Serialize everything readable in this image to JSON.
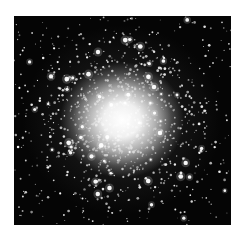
{
  "image": {
    "subject": "globular star cluster",
    "description": "Black-and-white astronomical photograph of a dense globular star cluster with a bright white core fading into scattered stars on a black sky, framed by a white border.",
    "colors": {
      "border": "#ffffff",
      "sky": "#050505",
      "core": "#ffffff",
      "star": "#ffffff"
    },
    "cluster_center": {
      "x": 108,
      "y": 104
    },
    "core_radius": 60,
    "star_count": 900,
    "bright_star_count": 60,
    "seed": 42
  }
}
